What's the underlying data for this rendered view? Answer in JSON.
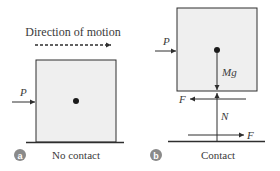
{
  "panels": [
    {
      "badge": "a",
      "caption": "No contact",
      "direction_label": "Direction of motion",
      "forces": {
        "push": "P"
      }
    },
    {
      "badge": "b",
      "caption": "Contact",
      "forces": {
        "push": "P",
        "weight": "Mg",
        "friction_on_block": "F",
        "normal": "N",
        "friction_on_floor": "F"
      }
    }
  ],
  "colors": {
    "box_fill": "#efefef",
    "stroke": "#2e2e2e",
    "badge": "#8a8a8a",
    "text": "#3a3a3a"
  }
}
